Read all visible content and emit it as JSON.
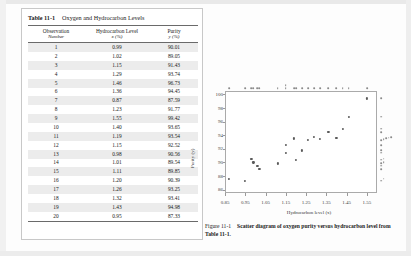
{
  "table": {
    "number": "Table 11-1",
    "title": "Oxygen and Hydrocarbon Levels",
    "columns": [
      {
        "line1": "Observation",
        "line2": "Number"
      },
      {
        "line1": "Hydrocarbon Level",
        "line2": "x (%)"
      },
      {
        "line1": "Purity",
        "line2": "y (%)"
      }
    ],
    "rows": [
      {
        "obs": "1",
        "x": "0.99",
        "y": "90.01"
      },
      {
        "obs": "2",
        "x": "1.02",
        "y": "89.05"
      },
      {
        "obs": "3",
        "x": "1.15",
        "y": "91.43"
      },
      {
        "obs": "4",
        "x": "1.29",
        "y": "93.74"
      },
      {
        "obs": "5",
        "x": "1.46",
        "y": "96.73"
      },
      {
        "obs": "6",
        "x": "1.36",
        "y": "94.45"
      },
      {
        "obs": "7",
        "x": "0.87",
        "y": "87.59"
      },
      {
        "obs": "8",
        "x": "1.23",
        "y": "91.77"
      },
      {
        "obs": "9",
        "x": "1.55",
        "y": "99.42"
      },
      {
        "obs": "10",
        "x": "1.40",
        "y": "93.65"
      },
      {
        "obs": "11",
        "x": "1.19",
        "y": "93.54"
      },
      {
        "obs": "12",
        "x": "1.15",
        "y": "92.52"
      },
      {
        "obs": "13",
        "x": "0.98",
        "y": "90.56"
      },
      {
        "obs": "14",
        "x": "1.01",
        "y": "89.54"
      },
      {
        "obs": "15",
        "x": "1.11",
        "y": "89.85"
      },
      {
        "obs": "16",
        "x": "1.20",
        "y": "90.39"
      },
      {
        "obs": "17",
        "x": "1.26",
        "y": "93.25"
      },
      {
        "obs": "18",
        "x": "1.32",
        "y": "93.41"
      },
      {
        "obs": "19",
        "x": "1.43",
        "y": "94.98"
      },
      {
        "obs": "20",
        "x": "0.95",
        "y": "87.33"
      }
    ]
  },
  "figure": {
    "number": "Figure 11-1",
    "caption": "Scatter diagram of oxygen purity versus hydrocarbon level from Table 11-1."
  },
  "chart_data": {
    "type": "scatter",
    "title": "",
    "xlabel": "Hydrocarbon level (x)",
    "ylabel": "Purity (y)",
    "xlim": [
      0.85,
      1.6
    ],
    "ylim": [
      85.5,
      100.5
    ],
    "xticks": [
      "0.85",
      "0.95",
      "1.05",
      "1.15",
      "1.25",
      "1.35",
      "1.45",
      "1.55"
    ],
    "xtick_values": [
      0.85,
      0.95,
      1.05,
      1.15,
      1.25,
      1.35,
      1.45,
      1.55
    ],
    "yticks": [
      "86",
      "88",
      "90",
      "92",
      "94",
      "96",
      "98",
      "100"
    ],
    "ytick_values": [
      86,
      88,
      90,
      92,
      94,
      96,
      98,
      100
    ],
    "grid": false,
    "legend": null,
    "marginal_plots": {
      "top": "dotplot of x",
      "right": "dotplot of y"
    },
    "x": [
      0.99,
      1.02,
      1.15,
      1.29,
      1.46,
      1.36,
      0.87,
      1.23,
      1.55,
      1.4,
      1.19,
      1.15,
      0.98,
      1.01,
      1.11,
      1.2,
      1.26,
      1.32,
      1.43,
      0.95
    ],
    "y": [
      90.01,
      89.05,
      91.43,
      93.74,
      96.73,
      94.45,
      87.59,
      91.77,
      99.42,
      93.65,
      93.54,
      92.52,
      90.56,
      89.54,
      89.85,
      90.39,
      93.25,
      93.41,
      94.98,
      87.33
    ]
  }
}
